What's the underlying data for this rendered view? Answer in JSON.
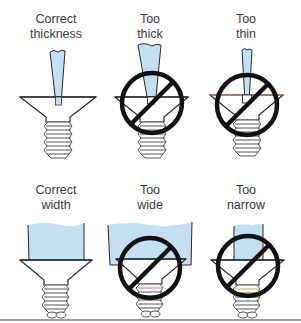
{
  "diagram": {
    "colors": {
      "blade_fill": "#c5dff2",
      "outline": "#2a2a2a",
      "prohibit": "#111111",
      "text": "#3a3a3a",
      "divider": "#9a9a9a"
    },
    "rows": [
      {
        "topic": "blade thickness",
        "panels": [
          {
            "line1": "Correct",
            "line2": "thickness",
            "status": "correct",
            "icon": "screwdriver-in-slot"
          },
          {
            "line1": "Too",
            "line2": "thick",
            "status": "incorrect",
            "icon": "prohibited-sign"
          },
          {
            "line1": "Too",
            "line2": "thin",
            "status": "incorrect",
            "icon": "prohibited-sign"
          }
        ]
      },
      {
        "topic": "blade width",
        "panels": [
          {
            "line1": "Correct",
            "line2": "width",
            "status": "correct",
            "icon": "screwdriver-in-slot"
          },
          {
            "line1": "Too",
            "line2": "wide",
            "status": "incorrect",
            "icon": "prohibited-sign"
          },
          {
            "line1": "Too",
            "line2": "narrow",
            "status": "incorrect",
            "icon": "prohibited-sign"
          }
        ]
      }
    ]
  }
}
